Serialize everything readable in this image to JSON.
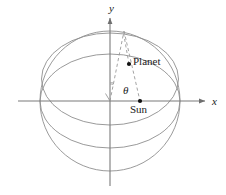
{
  "figure": {
    "background_color": "#ffffff",
    "line_color": "#8a8a8a",
    "axis_color": "#7a7a7a",
    "dash_color": "#9a9a9a",
    "point_color": "#000000",
    "text_color": "#1a1a1a",
    "width": 226,
    "height": 195
  },
  "axes": {
    "x_label": "x",
    "y_label": "y",
    "origin": {
      "x": 110,
      "y": 101
    },
    "x_axis": {
      "x1": 18,
      "y1": 101,
      "x2": 209,
      "y2": 101,
      "arrow": "right"
    },
    "y_axis": {
      "x1": 110,
      "y1": 186,
      "x2": 110,
      "y2": 14,
      "arrow": "up"
    }
  },
  "shapes": {
    "sphere": {
      "cx": 110,
      "cy": 101,
      "rx": 70,
      "ry": 70
    },
    "equator_ellipse": {
      "cx": 110,
      "cy": 101,
      "rx": 70,
      "ry": 47
    },
    "orbit_ellipse": {
      "cx": 110,
      "cy": 79,
      "rx": 68,
      "ry": 46
    }
  },
  "points": [
    {
      "name": "planet",
      "label": "Planet",
      "x": 129,
      "y": 64
    },
    {
      "name": "sun",
      "label": "Sun",
      "x": 140,
      "y": 101
    }
  ],
  "angle": {
    "symbol": "θ",
    "vertex": {
      "x": 110,
      "y": 101
    },
    "arc_radius": 17
  },
  "dashed_lines": [
    {
      "name": "origin-to-apex",
      "x1": 110,
      "y1": 101,
      "x2": 124,
      "y2": 31
    },
    {
      "name": "apex-to-sun",
      "x1": 124,
      "y1": 31,
      "x2": 140,
      "y2": 101
    },
    {
      "name": "planet-tick-upper",
      "x1": 129,
      "y1": 64,
      "x2": 124,
      "y2": 31
    }
  ]
}
